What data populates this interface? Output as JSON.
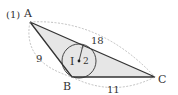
{
  "problem_number": "(1)",
  "vertices": {
    "A": {
      "label": "A",
      "x": 30,
      "y": 22
    },
    "B": {
      "label": "B",
      "x": 72,
      "y": 77
    },
    "C": {
      "label": "C",
      "x": 155,
      "y": 77
    }
  },
  "incenter": {
    "label": "I",
    "x": 79,
    "y": 61,
    "radius_label": "2",
    "radius_px": 17
  },
  "sides": {
    "AC": "18",
    "AB": "9",
    "BC": "11"
  },
  "colors": {
    "fill": "#e6e6e6",
    "stroke": "#333333",
    "dashed": "#999999"
  }
}
